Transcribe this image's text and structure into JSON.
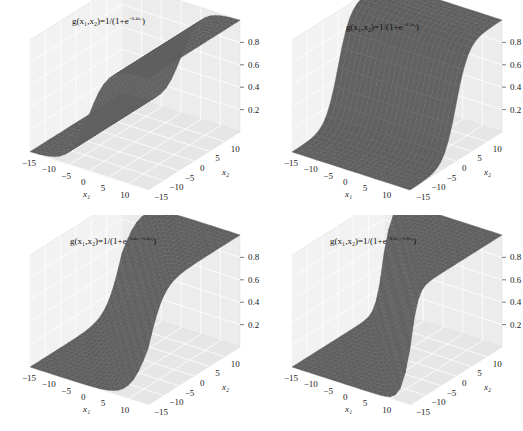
{
  "figure": {
    "panels": [
      {
        "id": "top-left",
        "title_base": "g(x₁,x₂)=1/(1+e",
        "title_exp": "−0.4x₁",
        "title_close": ")",
        "w1": 0.4,
        "w2": 0,
        "xlabel": "x₁",
        "ylabel": "x₂",
        "zlabel": "g(x₁,x₂)"
      },
      {
        "id": "top-right",
        "title_base": "g(x₁,x₂)=1/(1+e",
        "title_exp": "−0.5x₂",
        "title_close": ")",
        "w1": 0,
        "w2": 0.5,
        "xlabel": "x₁",
        "ylabel": "x₂",
        "zlabel": "g(x₁,x₂)"
      },
      {
        "id": "bottom-left",
        "title_base": "g(x₁,x₂)=1/(1+e",
        "title_exp": "−0.4x₁−0.4x₂",
        "title_close": ")",
        "w1": 0.4,
        "w2": 0.4,
        "xlabel": "x₁",
        "ylabel": "x₂",
        "zlabel": "g(x₁,x₂)"
      },
      {
        "id": "bottom-right",
        "title_base": "g(x₁,x₂)=1/(1+e",
        "title_exp": "−0.8x₁−0.8x₂",
        "title_close": ")",
        "w1": 0.8,
        "w2": 0.8,
        "xlabel": "x₁",
        "ylabel": "x₂",
        "zlabel": "g(x₁,x₂)"
      }
    ]
  },
  "chart_data": [
    {
      "type": "surface",
      "title": "g(x1,x2)=1/(1+e^(-0.4x1))",
      "xlabel": "x1",
      "ylabel": "x2",
      "zlabel": "g(x1,x2)",
      "x_ticks": [
        -15,
        -10,
        -5,
        0,
        5,
        10
      ],
      "y_ticks": [
        -15,
        -10,
        -5,
        0,
        5,
        10
      ],
      "z_ticks": [
        0.2,
        0.4,
        0.6,
        0.8
      ],
      "xlim": [
        -15,
        15
      ],
      "ylim": [
        -15,
        15
      ],
      "zlim": [
        0,
        1
      ],
      "function": "1/(1+exp(-0.4*x1))",
      "grid": true
    },
    {
      "type": "surface",
      "title": "g(x1,x2)=1/(1+e^(-0.5x2))",
      "xlabel": "x1",
      "ylabel": "x2",
      "zlabel": "g(x1,x2)",
      "x_ticks": [
        -15,
        -10,
        -5,
        0,
        5,
        10
      ],
      "y_ticks": [
        -15,
        -10,
        -5,
        0,
        5,
        10
      ],
      "z_ticks": [
        0.2,
        0.4,
        0.6,
        0.8
      ],
      "xlim": [
        -15,
        15
      ],
      "ylim": [
        -15,
        15
      ],
      "zlim": [
        0,
        1
      ],
      "function": "1/(1+exp(-0.5*x2))",
      "grid": true
    },
    {
      "type": "surface",
      "title": "g(x1,x2)=1/(1+e^(-0.4x1-0.4x2))",
      "xlabel": "x1",
      "ylabel": "x2",
      "zlabel": "g(x1,x2)",
      "x_ticks": [
        -15,
        -10,
        -5,
        0,
        5,
        10
      ],
      "y_ticks": [
        -15,
        -10,
        -5,
        0,
        5,
        10
      ],
      "z_ticks": [
        0.2,
        0.4,
        0.6,
        0.8
      ],
      "xlim": [
        -15,
        15
      ],
      "ylim": [
        -15,
        15
      ],
      "zlim": [
        0,
        1
      ],
      "function": "1/(1+exp(-0.4*x1-0.4*x2))",
      "grid": true
    },
    {
      "type": "surface",
      "title": "g(x1,x2)=1/(1+e^(-0.8x1-0.8x2))",
      "xlabel": "x1",
      "ylabel": "x2",
      "zlabel": "g(x1,x2)",
      "x_ticks": [
        -15,
        -10,
        -5,
        0,
        5,
        10
      ],
      "y_ticks": [
        -15,
        -10,
        -5,
        0,
        5,
        10
      ],
      "z_ticks": [
        0.2,
        0.4,
        0.6,
        0.8
      ],
      "xlim": [
        -15,
        15
      ],
      "ylim": [
        -15,
        15
      ],
      "zlim": [
        0,
        1
      ],
      "function": "1/(1+exp(-0.8*x1-0.8*x2))",
      "grid": true
    }
  ]
}
